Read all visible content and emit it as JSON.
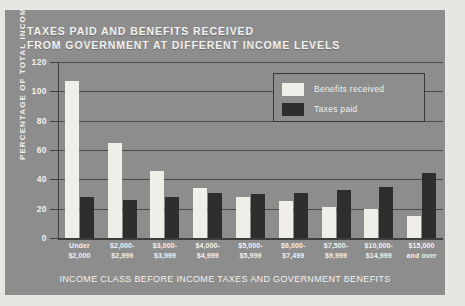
{
  "chart_data": {
    "type": "bar",
    "title": "TAXES PAID AND BENEFITS RECEIVED\nFROM GOVERNMENT AT DIFFERENT INCOME LEVELS",
    "xlabel": "INCOME CLASS BEFORE INCOME TAXES AND GOVERNMENT BENEFITS",
    "ylabel": "PERCENTAGE OF TOTAL INCOME",
    "ylim": [
      0,
      120
    ],
    "yticks": [
      0,
      20,
      40,
      60,
      80,
      100,
      120
    ],
    "grid": true,
    "legend_position": "top-right",
    "categories": [
      "Under\n$2,000",
      "$2,000-\n$2,999",
      "$3,000-\n$3,999",
      "$4,000-\n$4,999",
      "$5,000-\n$5,999",
      "$6,000-\n$7,499",
      "$7,500-\n$9,999",
      "$10,000-\n$14,999",
      "$15,000\nand over"
    ],
    "series": [
      {
        "name": "Benefits received",
        "color": "#efeee9",
        "values": [
          107,
          65,
          46,
          34,
          28,
          25,
          21,
          20,
          15
        ]
      },
      {
        "name": "Taxes paid",
        "color": "#2e2e2e",
        "values": [
          28,
          26,
          28,
          31,
          30,
          31,
          33,
          35,
          44
        ]
      }
    ]
  },
  "colors": {
    "panel_background": "#8d8d8d",
    "page_background": "#e8e6e1",
    "text": "#f2f1ee",
    "axis": "#3f3f3f",
    "benefits": "#efeee9",
    "taxes": "#2e2e2e"
  }
}
